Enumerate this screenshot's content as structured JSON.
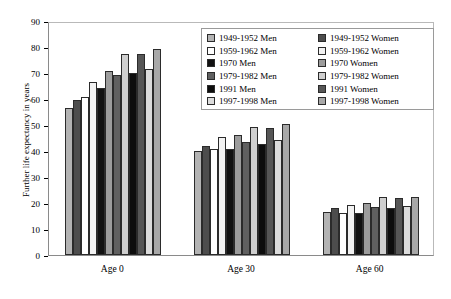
{
  "chart_data": {
    "type": "bar",
    "title": "",
    "xlabel": "",
    "ylabel": "Further life expectancy in years",
    "categories": [
      "Age 0",
      "Age 30",
      "Age 60"
    ],
    "ylim": [
      0,
      90
    ],
    "yticks": [
      0,
      10,
      20,
      30,
      40,
      50,
      60,
      70,
      80,
      90
    ],
    "grid": false,
    "legend_position": "upper-right-inside",
    "series": [
      {
        "name": "1949-1952 Men",
        "color": "#b3b3b3",
        "values": [
          56.5,
          40.0,
          16.4
        ]
      },
      {
        "name": "1949-1952 Women",
        "color": "#4d4d4d",
        "values": [
          59.8,
          42.0,
          18.1
        ]
      },
      {
        "name": "1959-1962 Men",
        "color": "#ffffff",
        "values": [
          60.7,
          40.8,
          16.3
        ]
      },
      {
        "name": "1959-1962 Women",
        "color": "#f2f2f2",
        "values": [
          66.5,
          45.5,
          19.2
        ]
      },
      {
        "name": "1970 Men",
        "color": "#111111",
        "values": [
          64.3,
          40.8,
          16.2
        ]
      },
      {
        "name": "1970 Women",
        "color": "#9c9c9c",
        "values": [
          70.8,
          46.3,
          19.9
        ]
      },
      {
        "name": "1979-1982 Men",
        "color": "#606060",
        "values": [
          69.2,
          43.4,
          18.6
        ]
      },
      {
        "name": "1979-1982 Women",
        "color": "#cfcfcf",
        "values": [
          77.2,
          49.3,
          22.4
        ]
      },
      {
        "name": "1991 Men",
        "color": "#0d0d0d",
        "values": [
          70.0,
          42.8,
          18.0
        ]
      },
      {
        "name": "1991 Women",
        "color": "#565656",
        "values": [
          77.4,
          48.9,
          22.1
        ]
      },
      {
        "name": "1997-1998 Men",
        "color": "#dcdcdc",
        "values": [
          71.5,
          44.4,
          18.8
        ]
      },
      {
        "name": "1997-1998 Women",
        "color": "#a8a8a8",
        "values": [
          79.1,
          50.4,
          22.5
        ]
      }
    ]
  },
  "legend": {
    "columns": [
      [
        {
          "label": "1949-1952 Men",
          "color": "#b3b3b3"
        },
        {
          "label": "1959-1962 Men",
          "color": "#ffffff"
        },
        {
          "label": "1970 Men",
          "color": "#111111"
        },
        {
          "label": "1979-1982 Men",
          "color": "#606060"
        },
        {
          "label": "1991 Men",
          "color": "#0d0d0d"
        },
        {
          "label": "1997-1998 Men",
          "color": "#dcdcdc"
        }
      ],
      [
        {
          "label": "1949-1952 Women",
          "color": "#4d4d4d"
        },
        {
          "label": "1959-1962 Women",
          "color": "#f2f2f2"
        },
        {
          "label": "1970 Women",
          "color": "#9c9c9c"
        },
        {
          "label": "1979-1982 Women",
          "color": "#cfcfcf"
        },
        {
          "label": "1991 Women",
          "color": "#565656"
        },
        {
          "label": "1997-1998 Women",
          "color": "#a8a8a8"
        }
      ]
    ]
  }
}
